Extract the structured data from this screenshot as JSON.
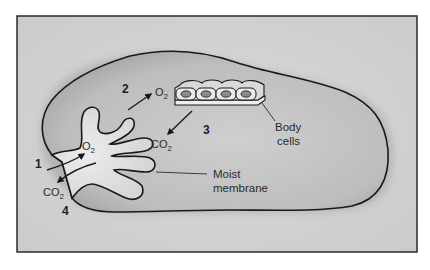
{
  "diagram": {
    "type": "respiratory gas exchange schematic",
    "colors": {
      "frame_background": "#d4d4d4",
      "body_fill": "#c8c8c8",
      "cavity_fill": "#e2e2e2",
      "outline": "#1a1a1a",
      "text": "#2a2a2a"
    },
    "steps": [
      {
        "number": "1",
        "description": "O2 enters"
      },
      {
        "number": "2",
        "description": "O2 transported to body cells"
      },
      {
        "number": "3",
        "description": "CO2 released from body cells"
      },
      {
        "number": "4",
        "description": "CO2 exits"
      }
    ],
    "gases": {
      "o2_base": "O",
      "co2_base": "CO",
      "subscript": "2"
    },
    "labels": {
      "body_cells_line1": "Body",
      "body_cells_line2": "cells",
      "membrane_line1": "Moist",
      "membrane_line2": "membrane"
    }
  }
}
